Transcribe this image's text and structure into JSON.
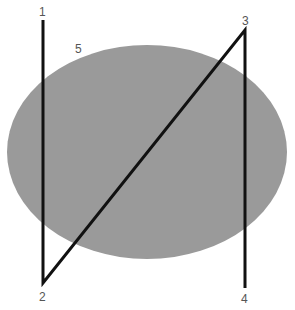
{
  "diagram": {
    "ellipse": {
      "cx": 147,
      "cy": 152,
      "rx": 140,
      "ry": 107,
      "fill": "#9a9a9a"
    },
    "path": {
      "stroke": "#111111",
      "stroke_width": 3,
      "points": [
        {
          "id": "1",
          "x": 43,
          "y": 20
        },
        {
          "id": "2",
          "x": 43,
          "y": 283
        },
        {
          "id": "3",
          "x": 245,
          "y": 30
        },
        {
          "id": "4",
          "x": 245,
          "y": 288
        }
      ]
    },
    "labels": [
      {
        "text": "1",
        "x": 39,
        "y": 16
      },
      {
        "text": "2",
        "x": 39,
        "y": 301
      },
      {
        "text": "3",
        "x": 242,
        "y": 25
      },
      {
        "text": "4",
        "x": 241,
        "y": 303
      },
      {
        "text": "5",
        "x": 75,
        "y": 53
      }
    ]
  }
}
